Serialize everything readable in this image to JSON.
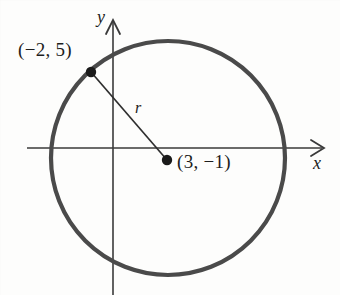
{
  "figure": {
    "type": "geometry-diagram",
    "background_color": "#fdfdfc",
    "stroke_color": "#4a4a4a",
    "line_color": "#3a3a3a",
    "text_color": "#1d1d1d"
  },
  "axes": {
    "x_label": "x",
    "y_label": "y",
    "origin_px": {
      "x": 113,
      "y": 148
    },
    "x_axis": {
      "x_start_px": 27,
      "x_end_px": 327,
      "y_px": 148
    },
    "y_axis": {
      "y_start_px": 18,
      "y_end_px": 295,
      "x_px": 113
    },
    "arrowheads": [
      "x-positive",
      "y-positive"
    ]
  },
  "circle": {
    "center_px": {
      "x": 168,
      "y": 158
    },
    "radius_px": 117,
    "stroke_width_px": 4
  },
  "points": [
    {
      "id": "point-on-circle",
      "label": "(−2, 5)",
      "x_value": -2,
      "y_value": 5,
      "px": {
        "x": 91,
        "y": 72
      },
      "label_px": {
        "x": 18,
        "y": 40
      }
    },
    {
      "id": "center-point",
      "label": "(3, −1)",
      "x_value": 3,
      "y_value": -1,
      "px": {
        "x": 167,
        "y": 160
      },
      "label_px": {
        "x": 177,
        "y": 152
      }
    }
  ],
  "radius_segment": {
    "label": "r",
    "from_px": {
      "x": 91,
      "y": 72
    },
    "to_px": {
      "x": 167,
      "y": 160
    },
    "label_px": {
      "x": 135,
      "y": 100
    }
  }
}
